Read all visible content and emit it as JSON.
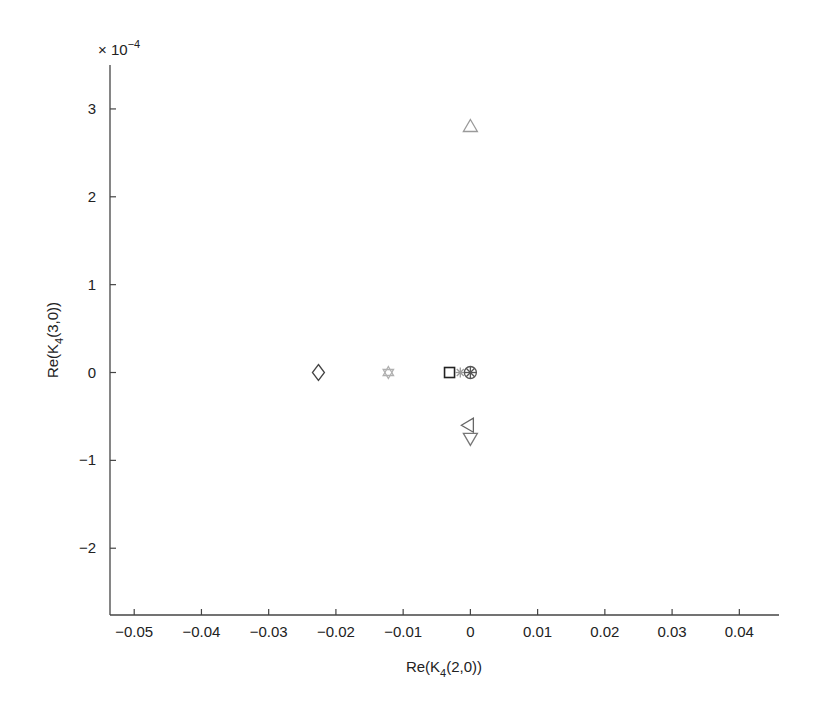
{
  "chart_data": {
    "type": "scatter",
    "title": "",
    "xlabel": "Re(K4(2,0))",
    "xlabel_parts": {
      "pre": "Re(K",
      "sub": "4",
      "post": "(2,0))"
    },
    "ylabel": "Re(K4(3,0))",
    "ylabel_parts": {
      "pre": "Re(K",
      "sub": "4",
      "post": "(3,0))"
    },
    "y_multiplier": "× 10",
    "y_multiplier_exp": "−4",
    "xlim": [
      -0.0536,
      0.0459
    ],
    "ylim": [
      -2.76,
      3.5
    ],
    "xticks": [
      -0.05,
      -0.04,
      -0.03,
      -0.02,
      -0.01,
      0,
      0.01,
      0.02,
      0.03,
      0.04
    ],
    "xtick_labels": [
      "−0.05",
      "−0.04",
      "−0.03",
      "−0.02",
      "−0.01",
      "0",
      "0.01",
      "0.02",
      "0.03",
      "0.04"
    ],
    "yticks": [
      -2,
      -1,
      0,
      1,
      2,
      3
    ],
    "ytick_labels": [
      "−2",
      "−1",
      "0",
      "1",
      "2",
      "3"
    ],
    "grid": false,
    "legend": null,
    "points": [
      {
        "marker": "diamond",
        "x": -0.0226,
        "y": 0.0,
        "color": "#444444"
      },
      {
        "marker": "hexagram",
        "x": -0.0122,
        "y": 0.0,
        "color": "#b0b0b0"
      },
      {
        "marker": "square",
        "x": -0.0031,
        "y": 0.0,
        "color": "#222222"
      },
      {
        "marker": "asterisk",
        "x": -0.0015,
        "y": 0.0,
        "color": "#9a9a9a"
      },
      {
        "marker": "circle-x",
        "x": 0.0,
        "y": 0.0,
        "color": "#555555"
      },
      {
        "marker": "triangle-up",
        "x": 0.0,
        "y": 2.8,
        "color": "#9a9a9a"
      },
      {
        "marker": "triangle-left",
        "x": -0.0003,
        "y": -0.6,
        "color": "#666666"
      },
      {
        "marker": "triangle-down",
        "x": 0.0,
        "y": -0.75,
        "color": "#777777"
      }
    ]
  }
}
